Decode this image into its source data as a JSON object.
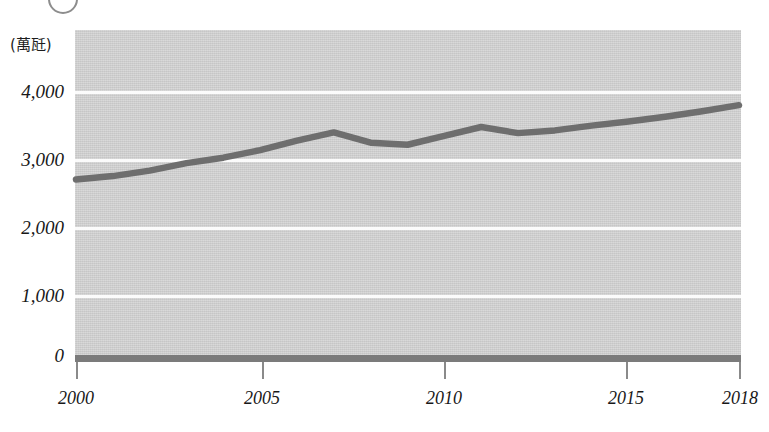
{
  "figure": {
    "marker_glyph": "circle-number-marker",
    "background_color": "#ffffff",
    "plot_background_color": "#d2d2d2",
    "gridline_color": "#fbfbfb",
    "axis_color": "#7b7b7b",
    "series_color": "#6e6e6e"
  },
  "chart_data": {
    "type": "line",
    "title": "",
    "xlabel": "",
    "ylabel": "(萬瓩)",
    "unit_label": "(萬瓩)",
    "grid": true,
    "legend": "none",
    "xlim": [
      2000,
      2018
    ],
    "ylim": [
      0,
      4500
    ],
    "ytick_labels": [
      "4,000",
      "3,000",
      "2,000",
      "1,000",
      "0"
    ],
    "ytick_values": [
      4000,
      3000,
      2000,
      1000,
      0
    ],
    "xtick_labels": [
      "2000",
      "2005",
      "2010",
      "2015",
      "2018"
    ],
    "xtick_values": [
      2000,
      2005,
      2010,
      2015,
      2018
    ],
    "x": [
      2000,
      2001,
      2002,
      2003,
      2004,
      2005,
      2006,
      2007,
      2008,
      2009,
      2010,
      2011,
      2012,
      2013,
      2014,
      2015,
      2016,
      2017,
      2018
    ],
    "values": [
      2610,
      2660,
      2740,
      2850,
      2930,
      3040,
      3180,
      3300,
      3150,
      3120,
      3250,
      3380,
      3290,
      3330,
      3400,
      3460,
      3530,
      3610,
      3700
    ],
    "series": [
      {
        "name": "裝置容量",
        "values": [
          2610,
          2660,
          2740,
          2850,
          2930,
          3040,
          3180,
          3300,
          3150,
          3120,
          3250,
          3380,
          3290,
          3330,
          3400,
          3460,
          3530,
          3610,
          3700
        ]
      }
    ]
  }
}
